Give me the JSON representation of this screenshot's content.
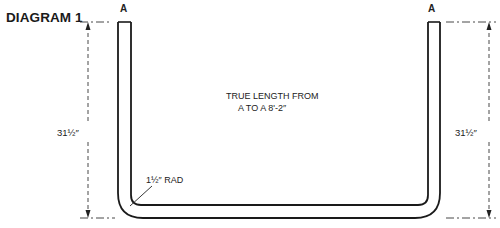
{
  "title": "DIAGRAM 1",
  "endpoints": {
    "left": "A",
    "right": "A"
  },
  "note": {
    "line1": "TRUE LENGTH FROM",
    "line2": "A TO A 8'-2″"
  },
  "dimensions": {
    "left_height": "31½″",
    "right_height": "31½″",
    "bend_radius": "1½″ RAD"
  }
}
